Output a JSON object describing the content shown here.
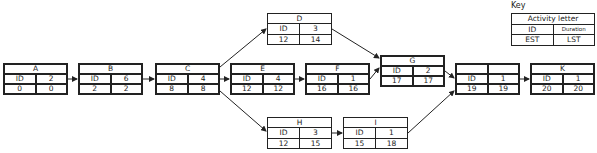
{
  "key": {
    "label": "Key",
    "title": "Activity letter",
    "id": "ID",
    "duration": "Duration",
    "est": "EST",
    "lst": "LST"
  },
  "nodes": {
    "A": {
      "letter": "A",
      "id": "ID",
      "duration": "2",
      "est": "0",
      "lst": "0"
    },
    "B": {
      "letter": "B",
      "id": "ID",
      "duration": "6",
      "est": "2",
      "lst": "2"
    },
    "C": {
      "letter": "C",
      "id": "ID",
      "duration": "4",
      "est": "8",
      "lst": "8"
    },
    "D": {
      "letter": "D",
      "id": "ID",
      "duration": "3",
      "est": "12",
      "lst": "14"
    },
    "E": {
      "letter": "E",
      "id": "ID",
      "duration": "4",
      "est": "12",
      "lst": "12"
    },
    "F": {
      "letter": "F",
      "id": "ID",
      "duration": "1",
      "est": "16",
      "lst": "16"
    },
    "G": {
      "letter": "G",
      "id": "ID",
      "duration": "2",
      "est": "17",
      "lst": "17"
    },
    "H": {
      "letter": "H",
      "id": "ID",
      "duration": "3",
      "est": "12",
      "lst": "15"
    },
    "I": {
      "letter": "I",
      "id": "ID",
      "duration": "1",
      "est": "15",
      "lst": "18"
    },
    "J": {
      "letter": "",
      "id": "ID",
      "duration": "1",
      "est": "19",
      "lst": "19"
    },
    "K": {
      "letter": "K",
      "id": "ID",
      "duration": "1",
      "est": "20",
      "lst": "20"
    }
  },
  "edges": [
    [
      "A",
      "B"
    ],
    [
      "B",
      "C"
    ],
    [
      "C",
      "D"
    ],
    [
      "C",
      "E"
    ],
    [
      "C",
      "H"
    ],
    [
      "E",
      "F"
    ],
    [
      "D",
      "G"
    ],
    [
      "F",
      "G"
    ],
    [
      "H",
      "I"
    ],
    [
      "G",
      "J"
    ],
    [
      "I",
      "J"
    ],
    [
      "J",
      "K"
    ]
  ]
}
